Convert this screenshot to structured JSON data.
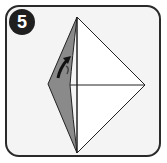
{
  "step": {
    "number": "5"
  },
  "diagram": {
    "colors": {
      "panel_background": "#f4f4f4",
      "panel_border": "#2a2a2a",
      "paper_white": "#ffffff",
      "paper_gray": "#8a8a8a",
      "lines": "#222222",
      "badge": "#1f1f1f"
    },
    "points": {
      "top": [
        77,
        17
      ],
      "left": [
        48,
        84
      ],
      "bottom": [
        77,
        153
      ],
      "right": [
        145,
        85
      ],
      "center": [
        77,
        85
      ]
    }
  }
}
